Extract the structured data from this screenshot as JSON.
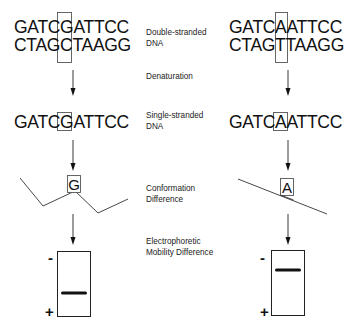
{
  "diagram": {
    "left_column": {
      "double_strand": {
        "top": "GATCGATTCC",
        "bottom": "CTAGCTAAGG"
      },
      "single_strand": "GATCGATTCC",
      "variant_base": "G",
      "gel": {
        "negative_label": "-",
        "positive_label": "+",
        "band_position": "low"
      }
    },
    "right_column": {
      "double_strand": {
        "top": "GATCAATTCC",
        "bottom": "CTAGTTAAGG"
      },
      "single_strand": "GATCAATTCC",
      "variant_base": "A",
      "gel": {
        "negative_label": "-",
        "positive_label": "+",
        "band_position": "high"
      }
    },
    "steps": [
      {
        "label_line1": "Double-stranded",
        "label_line2": "DNA"
      },
      {
        "label_line1": "Denaturation",
        "label_line2": ""
      },
      {
        "label_line1": "Single-stranded",
        "label_line2": "DNA"
      },
      {
        "label_line1": "Conformation",
        "label_line2": "Difference"
      },
      {
        "label_line1": "Electrophoretic",
        "label_line2": "Mobility Difference"
      }
    ],
    "colors": {
      "line": "#222222",
      "box": "#555555",
      "band": "#111111",
      "text": "#111111"
    }
  }
}
